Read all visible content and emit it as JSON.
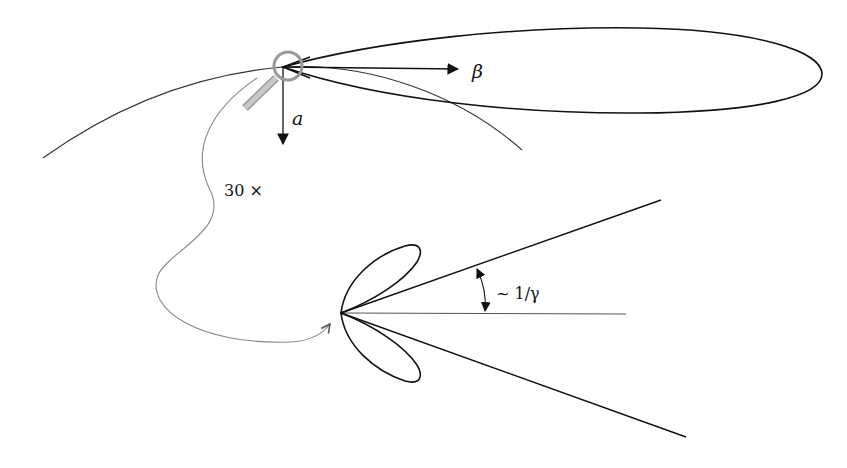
{
  "diagram": {
    "labels": {
      "beta": "β",
      "a": "a",
      "magnification": "30 ×",
      "angle": "~ 1/γ"
    },
    "colors": {
      "ink": "#111111",
      "thin_line": "#444444",
      "gray_curve": "#888888",
      "magnifier": "#999999",
      "magnifier_fill": "#c8c8c8",
      "background": "#ffffff"
    },
    "upper": {
      "origin": [
        283,
        67
      ],
      "beta_arrow_end": [
        460,
        70
      ],
      "a_arrow_end": [
        283,
        146
      ],
      "trajectory_start": [
        43,
        158
      ],
      "trajectory_end": [
        522,
        150
      ],
      "big_lobe_tip": [
        822,
        74
      ]
    },
    "lower": {
      "origin": [
        341,
        313
      ],
      "upper_ray_end": [
        661,
        200
      ],
      "lower_ray_end": [
        686,
        437
      ],
      "axis_end": [
        626,
        314
      ]
    }
  }
}
